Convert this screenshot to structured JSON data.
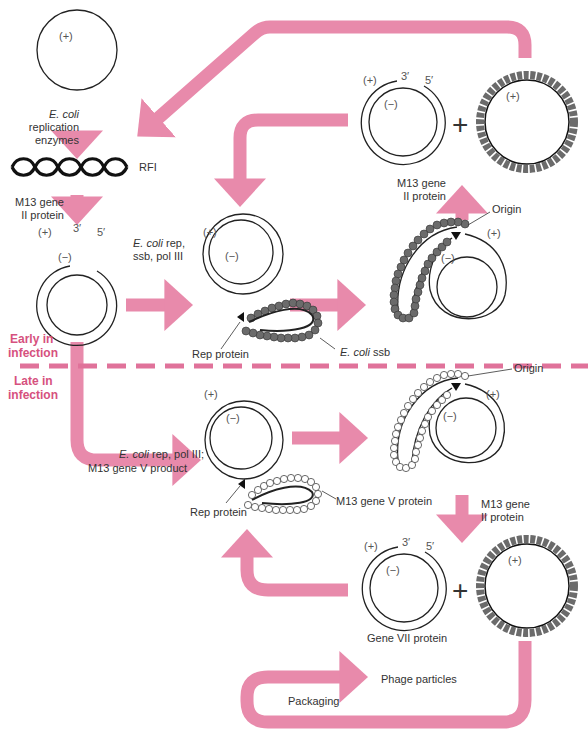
{
  "colors": {
    "arrow": "#e88aab",
    "phase_text": "#d6517e",
    "divider": "#e0729a",
    "strand": "#222222",
    "ssb_bead": "#6b6b6b",
    "gene5_bead": "#ffffff"
  },
  "labels": {
    "plus": "(+)",
    "minus": "(−)",
    "three_prime": "3′",
    "five_prime": "5′",
    "big_plus": "+",
    "ecoli_italic": "E. coli",
    "replication": "replication",
    "enzymes": "enzymes",
    "rfi": "RFI",
    "m13_gene": "M13 gene",
    "ii_protein": "II protein",
    "ecoli_rep_suffix": " rep,",
    "ssb_pol3": "ssb, pol III",
    "ssb_suffix": " ssb",
    "rep_protein": "Rep protein",
    "origin": "Origin",
    "early_1": "Early in",
    "early_2": "infection",
    "late_1": "Late in",
    "late_2": "infection",
    "late_enzymes_suffix": " rep, pol III;",
    "m13_gene_v_product": "M13 gene V product",
    "m13_gene_v_protein": "M13 gene V protein",
    "gene_vii_protein": "Gene VII protein",
    "phage_particles": "Phage particles",
    "packaging": "Packaging"
  }
}
